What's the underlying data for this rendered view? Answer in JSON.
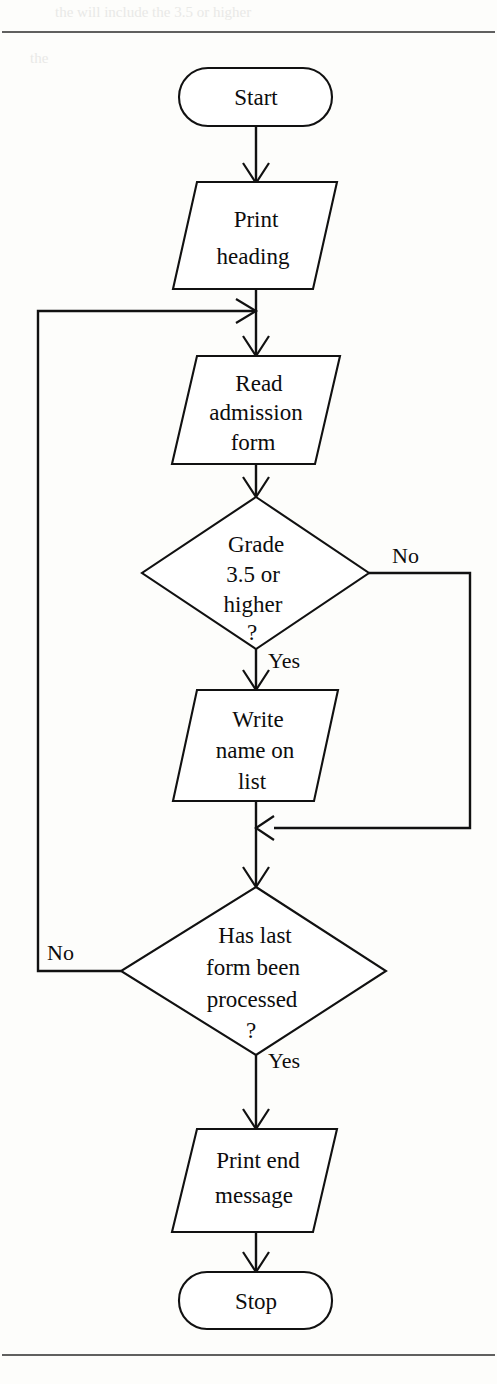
{
  "page": {
    "width": 497,
    "height": 1384,
    "background": "#fdfdfb",
    "ink": "#111111",
    "top_rule_y": 32,
    "bottom_rule_y": 1355
  },
  "figure": {
    "type": "flowchart",
    "title": ""
  },
  "nodes": [
    {
      "id": "start",
      "shape": "terminator",
      "lines": [
        "Start"
      ],
      "cx": 255,
      "cy": 97,
      "w": 152,
      "h": 58
    },
    {
      "id": "print-heading",
      "shape": "parallelogram",
      "lines": [
        "Print",
        "heading"
      ],
      "cx": 255,
      "cy": 235,
      "w": 165,
      "h": 108
    },
    {
      "id": "read-admission-form",
      "shape": "parallelogram",
      "lines": [
        "Read",
        "admission",
        "form"
      ],
      "cx": 255,
      "cy": 408,
      "w": 165,
      "h": 112
    },
    {
      "id": "grade-decision",
      "shape": "diamond",
      "lines": [
        "Grade",
        "3.5 or",
        "higher",
        "?"
      ],
      "cx": 255,
      "cy": 573,
      "w": 228,
      "h": 152
    },
    {
      "id": "write-name-on-list",
      "shape": "parallelogram",
      "lines": [
        "Write",
        "name on",
        "list"
      ],
      "cx": 255,
      "cy": 745,
      "w": 165,
      "h": 112
    },
    {
      "id": "last-form-decision",
      "shape": "diamond",
      "lines": [
        "Has last",
        "form been",
        "processed",
        "?"
      ],
      "cx": 253,
      "cy": 971,
      "w": 265,
      "h": 168
    },
    {
      "id": "print-end-message",
      "shape": "parallelogram",
      "lines": [
        "Print end",
        "message"
      ],
      "cx": 255,
      "cy": 1180,
      "w": 175,
      "h": 105
    },
    {
      "id": "stop",
      "shape": "terminator",
      "lines": [
        "Stop"
      ],
      "cx": 255,
      "cy": 1300,
      "w": 152,
      "h": 58
    }
  ],
  "edges": [
    {
      "id": "start-to-print-heading",
      "from": "start",
      "to": "print-heading",
      "label": ""
    },
    {
      "id": "print-heading-to-read-form",
      "from": "print-heading",
      "to": "read-admission-form",
      "label": ""
    },
    {
      "id": "read-form-to-grade",
      "from": "read-admission-form",
      "to": "grade-decision",
      "label": ""
    },
    {
      "id": "grade-yes-to-write",
      "from": "grade-decision",
      "to": "write-name-on-list",
      "label": "Yes"
    },
    {
      "id": "grade-no-bypass",
      "from": "grade-decision",
      "to": "merge-point",
      "label": "No"
    },
    {
      "id": "write-to-merge",
      "from": "write-name-on-list",
      "to": "merge-point",
      "label": ""
    },
    {
      "id": "merge-to-last-form",
      "from": "merge-point",
      "to": "last-form-decision",
      "label": ""
    },
    {
      "id": "last-form-no-loop",
      "from": "last-form-decision",
      "to": "read-admission-form",
      "label": "No"
    },
    {
      "id": "last-form-yes-to-print-end",
      "from": "last-form-decision",
      "to": "print-end-message",
      "label": "Yes"
    },
    {
      "id": "print-end-to-stop",
      "from": "print-end-message",
      "to": "stop",
      "label": ""
    }
  ],
  "labels": {
    "grade_no": "No",
    "grade_no_x": 392,
    "grade_no_y": 563,
    "grade_yes": "Yes",
    "grade_yes_x": 268,
    "grade_yes_y": 668,
    "last_no": "No",
    "last_no_x": 47,
    "last_no_y": 960,
    "last_yes": "Yes",
    "last_yes_x": 268,
    "last_yes_y": 1068
  },
  "node_text": {
    "start": [
      "Start"
    ],
    "print_heading": [
      "Print",
      "heading"
    ],
    "read_admission_form": [
      "Read",
      "admission",
      "form"
    ],
    "grade_decision": [
      "Grade",
      "3.5 or",
      "higher",
      "?"
    ],
    "write_name_on_list": [
      "Write",
      "name on",
      "list"
    ],
    "last_form_decision": [
      "Has last",
      "form been",
      "processed",
      "?"
    ],
    "print_end_message": [
      "Print end",
      "message"
    ],
    "stop": [
      "Stop"
    ]
  },
  "ghost_text": [
    {
      "text": "the will include the 3.5 or higher",
      "x": 55,
      "y": 10,
      "size": 15
    },
    {
      "text": "the",
      "x": 30,
      "y": 58,
      "size": 13
    }
  ]
}
